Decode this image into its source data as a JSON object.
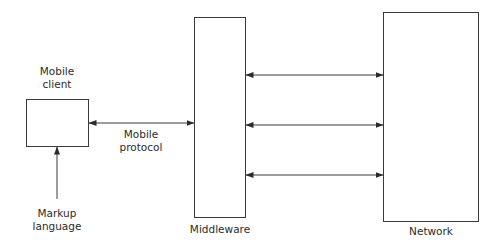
{
  "diagram": {
    "nodes": {
      "mobile_client": {
        "label_line1": "Mobile",
        "label_line2": "client"
      },
      "middleware": {
        "label": "Middleware"
      },
      "network": {
        "label": "Network"
      }
    },
    "edges": {
      "mobile_protocol": {
        "label_line1": "Mobile",
        "label_line2": "protocol",
        "from": "mobile_client",
        "to": "middleware",
        "direction": "bidirectional"
      },
      "middleware_network_1": {
        "from": "middleware",
        "to": "network",
        "direction": "bidirectional"
      },
      "middleware_network_2": {
        "from": "middleware",
        "to": "network",
        "direction": "bidirectional"
      },
      "middleware_network_3": {
        "from": "middleware",
        "to": "network",
        "direction": "bidirectional"
      },
      "markup_language": {
        "label_line1": "Markup",
        "label_line2": "language",
        "to": "mobile_client",
        "direction": "unidirectional"
      }
    },
    "colors": {
      "stroke": "#3a3a3a",
      "text": "#2b2b2b",
      "background": "#ffffff"
    }
  }
}
